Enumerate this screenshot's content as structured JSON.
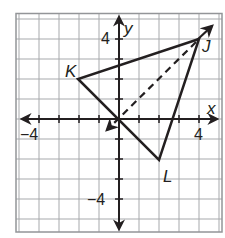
{
  "figure": {
    "type": "coordinate-plane",
    "unit_px": 20,
    "origin_px": [
      119,
      119
    ],
    "range": {
      "xmin": -5,
      "xmax": 5,
      "ymin": -5,
      "ymax": 5
    },
    "colors": {
      "grid": "#a7a9ac",
      "border": "#939598",
      "ink": "#231f20",
      "background": "#ffffff"
    },
    "axes": {
      "x_label": "x",
      "y_label": "y",
      "tick_labels": {
        "x_neg": "−4",
        "x_pos": "4",
        "y_pos": "4",
        "y_neg": "−4"
      }
    },
    "points": [
      {
        "name": "J",
        "label": "J",
        "x": 4,
        "y": 4
      },
      {
        "name": "K",
        "label": "K",
        "x": -2,
        "y": 2
      },
      {
        "name": "L",
        "label": "L",
        "x": 2,
        "y": -2
      }
    ],
    "triangle": [
      "J",
      "K",
      "L"
    ],
    "dashed_vector": {
      "from": [
        4,
        4
      ],
      "to": [
        -0.5,
        -0.5
      ],
      "style": "dashed",
      "arrowhead": true
    },
    "ray_beyond_J": {
      "from": [
        4,
        4
      ],
      "to": [
        4.6,
        4.5
      ],
      "arrowhead": true
    }
  }
}
